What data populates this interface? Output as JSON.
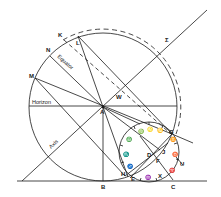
{
  "figure": {
    "colors": {
      "ink": "#1a1a1a",
      "background": "#ffffff"
    },
    "point_labels": {
      "K": "K",
      "L": "L",
      "N": "N",
      "M": "M",
      "A": "A",
      "W": "W",
      "B": "B",
      "H": "H",
      "E": "E",
      "X": "X",
      "C": "C",
      "U": "U",
      "D": "D",
      "F": "F",
      "J": "J",
      "G": "G",
      "S": "Σ"
    },
    "line_labels": {
      "equator": "Equator",
      "horizon": "Horizon",
      "axis": "Axis"
    },
    "zodiac_symbols": {
      "aries": "♈",
      "taurus": "♉",
      "gemini": "♊",
      "cancer": "♋",
      "leo": "♌",
      "virgo": "♍",
      "libra": "♎",
      "scorpio": "♏",
      "sagittarius": "♐",
      "capricorn": "♑",
      "aquarius": "♒",
      "pisces": "♓"
    }
  }
}
